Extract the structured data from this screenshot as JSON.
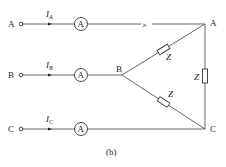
{
  "figure": {
    "caption": "(b)"
  },
  "terminals": [
    {
      "label": "A",
      "current": "I",
      "current_sub": "A",
      "meter": "A"
    },
    {
      "label": "B",
      "current": "I",
      "current_sub": "B",
      "meter": "A"
    },
    {
      "label": "C",
      "current": "I",
      "current_sub": "C",
      "meter": "A"
    }
  ],
  "nodes": {
    "A": "A",
    "B": "B",
    "C": "C"
  },
  "impedances": {
    "AB": "Z",
    "BC": "Z",
    "AC": "Z"
  },
  "break_mark": "×"
}
